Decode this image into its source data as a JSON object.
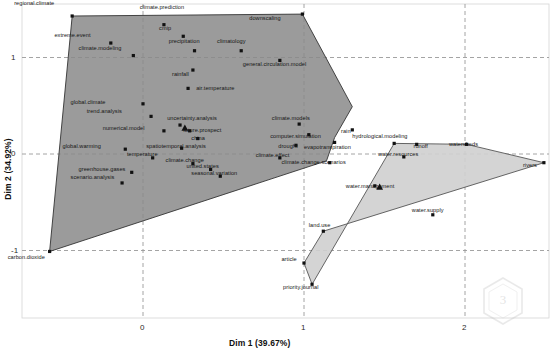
{
  "chart_data": {
    "type": "scatter",
    "title": "",
    "xlabel": "Dim 1 (39.67%)",
    "ylabel": "Dim 2 (34.92%)",
    "xlim": [
      -0.9,
      2.55
    ],
    "ylim": [
      -1.6,
      1.55
    ],
    "xticks": [
      0,
      1,
      2
    ],
    "xtick_labels": [
      "0",
      "1",
      "2"
    ],
    "yticks": [
      -1,
      0,
      1
    ],
    "ytick_labels": [
      "-1",
      "0",
      "1"
    ],
    "grid": true,
    "legend": "none",
    "clusters": [
      {
        "name": "climate-cluster",
        "fill": "#8a8a8a",
        "fill_opacity": 0.85,
        "stroke": "#333333",
        "centroid": {
          "x": 0.26,
          "y": 0.27
        },
        "hull": [
          {
            "x": -0.44,
            "y": 1.43
          },
          {
            "x": 0.99,
            "y": 1.45
          },
          {
            "x": 1.3,
            "y": 0.49
          },
          {
            "x": 1.19,
            "y": 0.17
          },
          {
            "x": 1.14,
            "y": -0.07
          },
          {
            "x": -0.58,
            "y": -1.01
          }
        ],
        "points": [
          {
            "label": "regional.climate",
            "x": -0.44,
            "y": 1.43,
            "lx": -0.8,
            "ly": 1.54
          },
          {
            "label": "climate.prediction",
            "x": 0.13,
            "y": 1.34,
            "lx": -0.02,
            "ly": 1.5
          },
          {
            "label": "downscaling",
            "x": 0.99,
            "y": 1.45,
            "lx": 0.66,
            "ly": 1.39
          },
          {
            "label": "cmip",
            "x": 0.25,
            "y": 1.22,
            "lx": 0.1,
            "ly": 1.29
          },
          {
            "label": "extreme.event",
            "x": -0.2,
            "y": 1.15,
            "lx": -0.55,
            "ly": 1.21
          },
          {
            "label": "precipitation",
            "x": 0.32,
            "y": 1.07,
            "lx": 0.16,
            "ly": 1.15
          },
          {
            "label": "climatology",
            "x": 0.61,
            "y": 1.07,
            "lx": 0.46,
            "ly": 1.15
          },
          {
            "label": "climate.modeling",
            "x": -0.06,
            "y": 1.02,
            "lx": -0.4,
            "ly": 1.08
          },
          {
            "label": "general.circulation.model",
            "x": 0.85,
            "y": 0.97,
            "lx": 0.62,
            "ly": 0.91
          },
          {
            "label": "rainfall",
            "x": 0.31,
            "y": 0.87,
            "lx": 0.18,
            "ly": 0.81
          },
          {
            "label": "air.temperature",
            "x": 0.28,
            "y": 0.68,
            "lx": 0.33,
            "ly": 0.66
          },
          {
            "label": "global.climate",
            "x": 0.0,
            "y": 0.52,
            "lx": -0.45,
            "ly": 0.52
          },
          {
            "label": "trend.analysis",
            "x": 0.05,
            "y": 0.39,
            "lx": -0.35,
            "ly": 0.42
          },
          {
            "label": "uncertainty.analysis",
            "x": 0.23,
            "y": 0.3,
            "lx": 0.15,
            "ly": 0.35
          },
          {
            "label": "climate.models",
            "x": 0.97,
            "y": 0.31,
            "lx": 0.8,
            "ly": 0.35
          },
          {
            "label": "numerical.model",
            "x": 0.13,
            "y": 0.24,
            "lx": -0.25,
            "ly": 0.25
          },
          {
            "label": "future.prospect",
            "x": 0.29,
            "y": 0.24,
            "lx": 0.25,
            "ly": 0.23
          },
          {
            "label": "computer.simulation",
            "x": 1.03,
            "y": 0.2,
            "lx": 0.79,
            "ly": 0.17
          },
          {
            "label": "china",
            "x": 0.34,
            "y": 0.16,
            "lx": 0.3,
            "ly": 0.14
          },
          {
            "label": "drought",
            "x": 0.95,
            "y": 0.09,
            "lx": 0.84,
            "ly": 0.06
          },
          {
            "label": "global.warming",
            "x": -0.11,
            "y": 0.05,
            "lx": -0.5,
            "ly": 0.06
          },
          {
            "label": "spatiotemporal.analysis",
            "x": 0.24,
            "y": 0.06,
            "lx": 0.02,
            "ly": 0.06
          },
          {
            "label": "temperature",
            "x": 0.06,
            "y": -0.04,
            "lx": -0.1,
            "ly": -0.02
          },
          {
            "label": "climate.effect",
            "x": 0.85,
            "y": -0.04,
            "lx": 0.7,
            "ly": -0.03
          },
          {
            "label": "climate.change",
            "x": 0.31,
            "y": -0.1,
            "lx": 0.14,
            "ly": -0.08
          },
          {
            "label": "climate.change.scenarios",
            "x": 1.16,
            "y": -0.09,
            "lx": 0.86,
            "ly": -0.1
          },
          {
            "label": "united.states",
            "x": 0.42,
            "y": -0.16,
            "lx": 0.27,
            "ly": -0.15
          },
          {
            "label": "greenhouse.gases",
            "x": -0.07,
            "y": -0.19,
            "lx": -0.4,
            "ly": -0.18
          },
          {
            "label": "seasonal.variation",
            "x": 0.48,
            "y": -0.23,
            "lx": 0.3,
            "ly": -0.22
          },
          {
            "label": "scenario.analysis",
            "x": -0.13,
            "y": -0.3,
            "lx": -0.45,
            "ly": -0.26
          },
          {
            "label": "carbon.dioxide",
            "x": -0.58,
            "y": -1.01,
            "lx": -0.84,
            "ly": -1.09
          },
          {
            "label": "rain",
            "x": 1.3,
            "y": 0.25,
            "lx": 1.23,
            "ly": 0.22
          },
          {
            "label": "evapotranspiration",
            "x": 1.19,
            "y": 0.12,
            "lx": 1.0,
            "ly": 0.05
          }
        ]
      },
      {
        "name": "water-cluster",
        "fill": "#cfcfcf",
        "fill_opacity": 0.9,
        "stroke": "#555555",
        "centroid": {
          "x": 1.47,
          "y": -0.34
        },
        "hull": [
          {
            "x": 1.56,
            "y": 0.11
          },
          {
            "x": 2.01,
            "y": 0.1
          },
          {
            "x": 2.49,
            "y": -0.09
          },
          {
            "x": 1.12,
            "y": -0.8
          },
          {
            "x": 1.0,
            "y": -1.13
          },
          {
            "x": 1.05,
            "y": -1.35
          }
        ],
        "points": [
          {
            "label": "hydrological.modeling",
            "x": 1.56,
            "y": 0.11,
            "lx": 1.3,
            "ly": 0.17
          },
          {
            "label": "runoff",
            "x": 1.7,
            "y": 0.1,
            "lx": 1.68,
            "ly": 0.06
          },
          {
            "label": "watersheds",
            "x": 2.01,
            "y": 0.1,
            "lx": 1.9,
            "ly": 0.08
          },
          {
            "label": "water.resources",
            "x": 1.62,
            "y": -0.03,
            "lx": 1.46,
            "ly": -0.02
          },
          {
            "label": "rivers",
            "x": 2.49,
            "y": -0.09,
            "lx": 2.36,
            "ly": -0.13
          },
          {
            "label": "water.management",
            "x": 1.44,
            "y": -0.33,
            "lx": 1.26,
            "ly": -0.35
          },
          {
            "label": "water.supply",
            "x": 1.8,
            "y": -0.63,
            "lx": 1.67,
            "ly": -0.6
          },
          {
            "label": "land.use",
            "x": 1.12,
            "y": -0.8,
            "lx": 1.03,
            "ly": -0.76
          },
          {
            "label": "article",
            "x": 1.0,
            "y": -1.13,
            "lx": 0.86,
            "ly": -1.11
          },
          {
            "label": "priority.journal",
            "x": 1.05,
            "y": -1.35,
            "lx": 0.87,
            "ly": -1.4
          }
        ]
      }
    ]
  },
  "watermark": {
    "name": "hexagon-logo-watermark"
  }
}
